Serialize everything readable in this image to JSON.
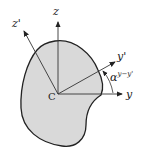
{
  "diagram": {
    "center_label": "C",
    "axes": {
      "z": "z",
      "y": "y",
      "z_prime": "z'",
      "y_prime": "y'"
    },
    "angle_label": "α",
    "angle_superscript": "y−y'",
    "colors": {
      "fill": "#d9d9d9",
      "stroke": "#222222"
    }
  }
}
